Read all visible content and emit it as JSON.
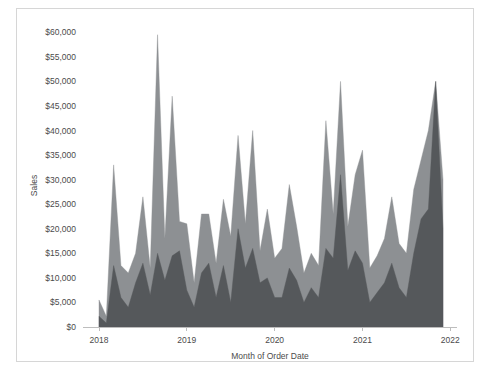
{
  "chart_data": {
    "type": "area",
    "title": "",
    "subtitle": "",
    "xlabel": "Month of Order Date",
    "ylabel": "Sales",
    "ylim": [
      0,
      62500
    ],
    "xlim": [
      "2018-01",
      "2022-01"
    ],
    "grid": false,
    "legend": "none",
    "y_ticks": [
      0,
      5000,
      10000,
      15000,
      20000,
      25000,
      30000,
      35000,
      40000,
      45000,
      50000,
      55000,
      60000
    ],
    "y_tick_labels": [
      "$0",
      "$5,000",
      "$10,000",
      "$15,000",
      "$20,000",
      "$25,000",
      "$30,000",
      "$35,000",
      "$40,000",
      "$45,000",
      "$50,000",
      "$55,000",
      "$60,000"
    ],
    "x_ticks": [
      "2018",
      "2019",
      "2020",
      "2021",
      "2022"
    ],
    "x_tick_labels": [
      "2018",
      "2019",
      "2020",
      "2021",
      "2022"
    ],
    "colors": {
      "series_back": "#8d9093",
      "series_front": "#55585b",
      "axis": "#bdbdbd",
      "text": "#4b4b4b",
      "background": "#ffffff",
      "border": "#d6d6d6"
    },
    "x": [
      "2018-01",
      "2018-02",
      "2018-03",
      "2018-04",
      "2018-05",
      "2018-06",
      "2018-07",
      "2018-08",
      "2018-09",
      "2018-10",
      "2018-11",
      "2018-12",
      "2019-01",
      "2019-02",
      "2019-03",
      "2019-04",
      "2019-05",
      "2019-06",
      "2019-07",
      "2019-08",
      "2019-09",
      "2019-10",
      "2019-11",
      "2019-12",
      "2020-01",
      "2020-02",
      "2020-03",
      "2020-04",
      "2020-05",
      "2020-06",
      "2020-07",
      "2020-08",
      "2020-09",
      "2020-10",
      "2020-11",
      "2020-12",
      "2021-01",
      "2021-02",
      "2021-03",
      "2021-04",
      "2021-05",
      "2021-06",
      "2021-07",
      "2021-08",
      "2021-09",
      "2021-10",
      "2021-11",
      "2021-12"
    ],
    "series": [
      {
        "name": "Sales (upper)",
        "color": "#8d9093",
        "values": [
          5500,
          2200,
          33000,
          12500,
          11000,
          15000,
          26500,
          12000,
          59500,
          18000,
          47000,
          21500,
          21000,
          9000,
          23000,
          23000,
          13000,
          26000,
          18500,
          39000,
          21000,
          40000,
          15500,
          24000,
          14000,
          16000,
          29000,
          20500,
          11000,
          15000,
          12500,
          42000,
          23000,
          50000,
          20500,
          31000,
          36000,
          12000,
          14500,
          18000,
          26500,
          17000,
          15000,
          28000,
          34000,
          40000,
          50000,
          30000
        ]
      },
      {
        "name": "Sales (lower)",
        "color": "#55585b",
        "values": [
          2200,
          800,
          12500,
          6000,
          4000,
          9000,
          13000,
          6500,
          15000,
          9500,
          14500,
          15500,
          7500,
          4000,
          11000,
          13000,
          6000,
          12500,
          5000,
          20000,
          12000,
          16000,
          9000,
          10000,
          6000,
          6000,
          12000,
          9500,
          5000,
          8000,
          6000,
          16000,
          14000,
          31000,
          11500,
          15500,
          13000,
          5000,
          7000,
          9000,
          13000,
          8000,
          6000,
          15000,
          22000,
          24000,
          50000,
          20000
        ]
      }
    ]
  }
}
